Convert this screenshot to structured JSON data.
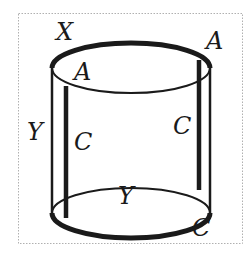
{
  "figure": {
    "colors": {
      "stroke": "#1a1a1a",
      "border": "#b0b0b0",
      "background": "#ffffff"
    },
    "labels": {
      "top_outer_left": "X",
      "top_outer_right": "A",
      "top_inner": "A",
      "side_left": "Y",
      "side_inner_left": "C",
      "side_inner_right": "C",
      "bottom_center": "Y",
      "bottom_right": "C"
    }
  }
}
